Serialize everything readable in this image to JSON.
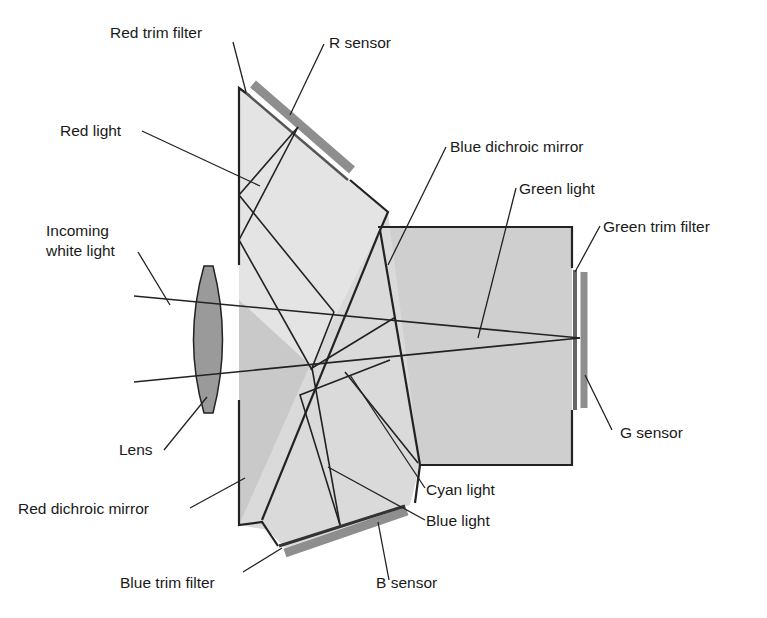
{
  "diagram": {
    "colors": {
      "prism_light": "#e3e3e3",
      "prism_mid": "#d2d2d2",
      "prism_dark": "#c4c4c4",
      "sensor": "#8e8e8e",
      "lens": "#9a9a9a",
      "line": "#222222"
    },
    "labels": {
      "red_trim_filter": "Red trim filter",
      "r_sensor": "R sensor",
      "red_light": "Red light",
      "blue_dichroic_mirror": "Blue dichroic mirror",
      "green_light": "Green light",
      "green_trim_filter": "Green trim filter",
      "incoming_white_light_1": "Incoming",
      "incoming_white_light_2": "white light",
      "lens": "Lens",
      "g_sensor": "G sensor",
      "red_dichroic_mirror": "Red dichroic mirror",
      "cyan_light": "Cyan light",
      "blue_light": "Blue light",
      "blue_trim_filter": "Blue trim filter",
      "b_sensor": "B sensor"
    }
  }
}
